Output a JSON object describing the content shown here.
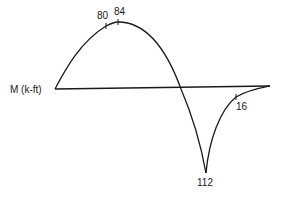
{
  "diagram": {
    "axis_label": "M (k-ft)",
    "positive_region": {
      "labels": [
        "80",
        "84"
      ],
      "peak_value": "84",
      "marked_value": "80"
    },
    "negative_region": {
      "trough_value": "112",
      "marked_value": "16"
    },
    "line_color": "#1a1a1a",
    "background": "#ffffff"
  }
}
